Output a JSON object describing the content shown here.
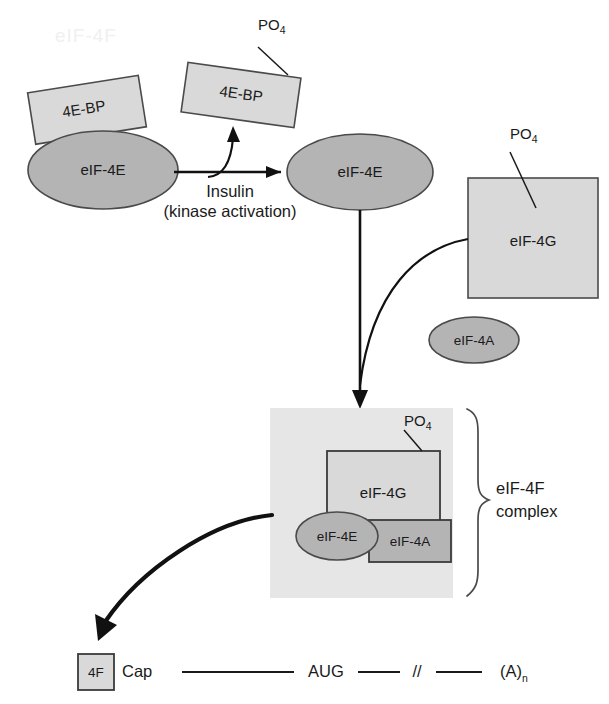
{
  "figure": {
    "watermark_text": "eIF-4F",
    "colors": {
      "background": "#ffffff",
      "light_gray_fill": "#d9d9d9",
      "pale_gray_fill": "#e8e8e8",
      "mid_gray_fill": "#b4b4b4",
      "complex_panel_fill": "#e6e6e6",
      "outline": "#4a4a4a",
      "text": "#1a1a1a",
      "arrow": "#111111"
    }
  },
  "stage_bound": {
    "binding_protein_label": "4E-BP",
    "factor_label": "eIF-4E"
  },
  "stage_released": {
    "binding_protein_label": "4E-BP",
    "phosphate_label": "PO",
    "phosphate_subscript": "4",
    "factor_label": "eIF-4E"
  },
  "reaction": {
    "line1": "Insulin",
    "line2": "(kinase activation)"
  },
  "free_components": {
    "scaffold_label": "eIF-4G",
    "scaffold_phosphate_label": "PO",
    "scaffold_phosphate_subscript": "4",
    "helicase_label": "eIF-4A"
  },
  "complex": {
    "scaffold_label": "eIF-4G",
    "cap_binding_label": "eIF-4E",
    "helicase_label": "eIF-4A",
    "phosphate_label": "PO",
    "phosphate_subscript": "4",
    "brace_label_line1": "eIF-4F",
    "brace_label_line2": "complex"
  },
  "mrna": {
    "complex_tag": "4F",
    "cap_label": "Cap",
    "start_codon_label": "AUG",
    "break_label": "//",
    "polyA_label": "(A)",
    "polyA_subscript": "n"
  }
}
